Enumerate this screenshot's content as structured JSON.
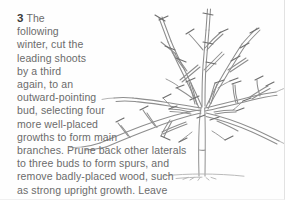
{
  "page": {
    "type": "instructional-illustration",
    "background_color": "#fefefe",
    "border_color": "#e2e2e2"
  },
  "instruction": {
    "step_number": "3",
    "text_color": "#6b6b6b",
    "full_text": "The following winter, cut the leading shoots by a third again, to an outward-pointing bud, selecting four more well-placed growths to form main branches. Prune back other laterals to three buds to form spurs, and remove badly-placed wood, such as strong upright growth. Leave some outside laterals unpruned.",
    "lines": [
      "The",
      "following",
      "winter, cut the",
      "leading shoots",
      "by a third",
      "again, to an",
      "outward-pointing",
      "bud, selecting four",
      "more well-placed",
      "growths to form main",
      "branches. Prune back other laterals",
      "to three buds to form spurs, and",
      "remove badly-placed wood, such",
      "as strong upright growth. Leave",
      "some outside laterals unpruned."
    ]
  },
  "illustration": {
    "subject": "open-centre fruit tree in winter, pruned",
    "line_color": "#8a8a8a",
    "trunk_color": "#9a9a9a",
    "ground_color": "#b5b5b5",
    "cut_mark_color": "#707070",
    "description": "Bare-branched fruit tree with short trunk, four main scaffold branches spreading outward, upright leading shoots, and short tick marks indicating pruning cuts."
  }
}
